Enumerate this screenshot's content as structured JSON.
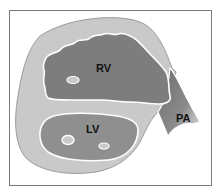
{
  "diagram": {
    "type": "anatomical cross-section",
    "labels": {
      "rv": "RV",
      "lv": "LV",
      "pa": "PA"
    },
    "colors": {
      "background": "#ffffff",
      "frame": "#7a7a7a",
      "myocardium": "#c9c9c9",
      "rv_cavity": "#7d7d7d",
      "lv_cavity": "#8f8f8f",
      "pa_gradient_dark": "#6e6e6e",
      "pa_gradient_light": "#e0e0e0",
      "outline": "#ffffff"
    }
  }
}
